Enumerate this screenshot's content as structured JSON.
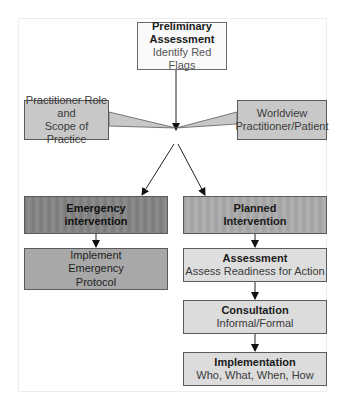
{
  "diagram": {
    "type": "flowchart",
    "nodes": {
      "preliminary": {
        "title": "Preliminary Assessment",
        "title_line1": "Preliminary",
        "title_line2": "Assessment",
        "subtitle": "Identify Red Flags"
      },
      "practitioner_role": {
        "line1": "Practitioner Role",
        "line2": "and",
        "line3": "Scope of Practice"
      },
      "worldview": {
        "line1": "Worldview",
        "line2": "Practitioner/Patient"
      },
      "emergency_intervention": {
        "line1": "Emergency",
        "line2": "intervention"
      },
      "implement_emergency": {
        "line1": "Implement",
        "line2": "Emergency",
        "line3": "Protocol"
      },
      "planned_intervention": {
        "line1": "Planned",
        "line2": "Intervention"
      },
      "assessment": {
        "title": "Assessment",
        "subtitle": "Assess Readiness for Action"
      },
      "consultation": {
        "title": "Consultation",
        "subtitle": "Informal/Formal"
      },
      "implementation": {
        "title": "Implementation",
        "subtitle": "Who, What, When, How"
      }
    },
    "edges": [
      [
        "preliminary",
        "emergency_intervention"
      ],
      [
        "preliminary",
        "planned_intervention"
      ],
      [
        "practitioner_role",
        "decision_point"
      ],
      [
        "worldview",
        "decision_point"
      ],
      [
        "emergency_intervention",
        "implement_emergency"
      ],
      [
        "planned_intervention",
        "assessment"
      ],
      [
        "assessment",
        "consultation"
      ],
      [
        "consultation",
        "implementation"
      ]
    ]
  }
}
